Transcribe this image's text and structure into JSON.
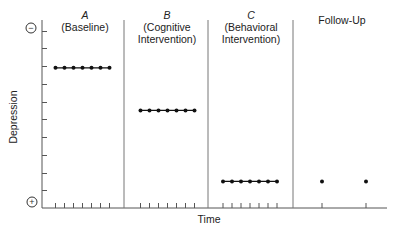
{
  "chart_data": {
    "type": "line",
    "title": "",
    "xlabel": "Time",
    "ylabel": "Depression",
    "y_axis_end_labels": {
      "top": "−",
      "bottom": "+"
    },
    "y_ticks_count": 10,
    "ylim": [
      0,
      10.5
    ],
    "grid": false,
    "legend": null,
    "phases": [
      {
        "letter": "A",
        "name": "(Baseline)",
        "name_lines": [
          "(Baseline)"
        ]
      },
      {
        "letter": "B",
        "name": "(Cognitive Intervention)",
        "name_lines": [
          "(Cognitive",
          "Intervention)"
        ]
      },
      {
        "letter": "C",
        "name": "(Behavioral Intervention)",
        "name_lines": [
          "(Behavioral",
          "Intervention)"
        ]
      },
      {
        "letter": "",
        "name": "Follow-Up",
        "name_lines": [
          "Follow-Up"
        ]
      }
    ],
    "series": [
      {
        "name": "A (Baseline)",
        "x": [
          1,
          2,
          3,
          4,
          5,
          6,
          7
        ],
        "values": [
          7.9,
          7.9,
          7.9,
          7.9,
          7.9,
          7.9,
          7.9
        ],
        "connected": true
      },
      {
        "name": "B (Cognitive Intervention)",
        "x": [
          8,
          9,
          10,
          11,
          12,
          13,
          14
        ],
        "values": [
          5.5,
          5.5,
          5.5,
          5.5,
          5.5,
          5.5,
          5.5
        ],
        "connected": true
      },
      {
        "name": "C (Behavioral Intervention)",
        "x": [
          15,
          16,
          17,
          18,
          19,
          20,
          21
        ],
        "values": [
          1.5,
          1.5,
          1.5,
          1.5,
          1.5,
          1.5,
          1.5
        ],
        "connected": true
      },
      {
        "name": "Follow-Up",
        "x": [
          22,
          23
        ],
        "values": [
          1.5,
          1.5
        ],
        "connected": false
      }
    ]
  },
  "labels": {
    "ylabel": "Depression",
    "xlabel": "Time",
    "top_symbol": "−",
    "bottom_symbol": "+",
    "phaseA_letter": "A",
    "phaseA_name1": "(Baseline)",
    "phaseB_letter": "B",
    "phaseB_name1": "(Cognitive",
    "phaseB_name2": "Intervention)",
    "phaseC_letter": "C",
    "phaseC_name1": "(Behavioral",
    "phaseC_name2": "Intervention)",
    "phaseD_name1": "Follow-Up"
  },
  "colors": {
    "axis": "#555555",
    "data": "#111111"
  }
}
